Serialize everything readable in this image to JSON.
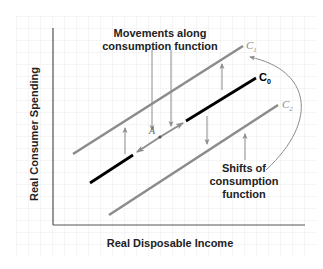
{
  "diagram": {
    "type": "economics-consumption-function",
    "axes": {
      "x_label": "Real Disposable Income",
      "y_label": "Real Consumer Spending"
    },
    "curves": [
      {
        "id": "C1",
        "label_main": "C",
        "label_sub": "1",
        "color": "#8c8c8c",
        "role": "shifted-up"
      },
      {
        "id": "C0",
        "label_main": "C",
        "label_sub": "0",
        "color": "#000000",
        "role": "original"
      },
      {
        "id": "C2",
        "label_main": "C",
        "label_sub": "2",
        "color": "#8c8c8c",
        "role": "shifted-down"
      }
    ],
    "point": {
      "label": "A"
    },
    "annotations": {
      "movements_line1": "Movements along",
      "movements_line2": "consumption function",
      "shifts_line1": "Shifts of",
      "shifts_line2": "consumption",
      "shifts_line3": "function"
    },
    "colors": {
      "grid": "#ececec",
      "axis": "#555555",
      "shift_line": "#8c8c8c",
      "base_line": "#000000",
      "arrow": "#8c8c8c"
    }
  }
}
